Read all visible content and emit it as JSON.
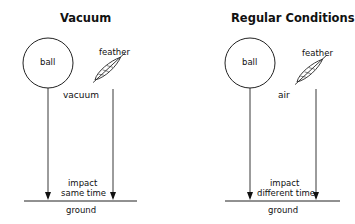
{
  "panels": [
    {
      "title": "Vacuum",
      "ball_label": "ball",
      "feather_label": "feather",
      "medium_label": "vacuum",
      "impact_line1": "impact",
      "impact_line2": "same time",
      "ground_label": "ground"
    },
    {
      "title": "Regular Conditions",
      "ball_label": "ball",
      "feather_label": "feather",
      "medium_label": "air",
      "impact_line1": "impact",
      "impact_line2": "different time",
      "ground_label": "ground"
    }
  ]
}
